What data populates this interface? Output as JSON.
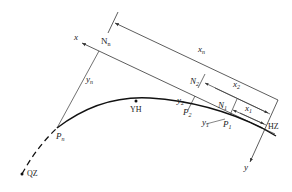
{
  "diagram": {
    "type": "road-curve-coordinate-layout",
    "axes": {
      "x": {
        "label": "x"
      },
      "y": {
        "label": "y"
      }
    },
    "points": {
      "start": {
        "label": "QZ"
      },
      "curve_point": {
        "label": "YH"
      },
      "end": {
        "label": "HZ"
      },
      "P_n": {
        "label": "P",
        "sub": "n"
      },
      "P_2": {
        "label": "P",
        "sub": "2"
      },
      "P_1": {
        "label": "P",
        "sub": "1"
      },
      "N_n": {
        "label": "N",
        "sub": "n"
      },
      "N_2": {
        "label": "N",
        "sub": "2"
      },
      "N_1": {
        "label": "N",
        "sub": "1"
      }
    },
    "dimensions": {
      "x_n": {
        "label": "x",
        "sub": "n"
      },
      "x_2": {
        "label": "x",
        "sub": "2"
      },
      "x_1": {
        "label": "x",
        "sub": "1"
      },
      "y_n": {
        "label": "y",
        "sub": "n"
      },
      "y_2": {
        "label": "y",
        "sub": "2"
      },
      "y_1": {
        "label": "y",
        "sub": "1"
      }
    },
    "colors": {
      "line": "#333333",
      "curve": "#111111"
    }
  }
}
